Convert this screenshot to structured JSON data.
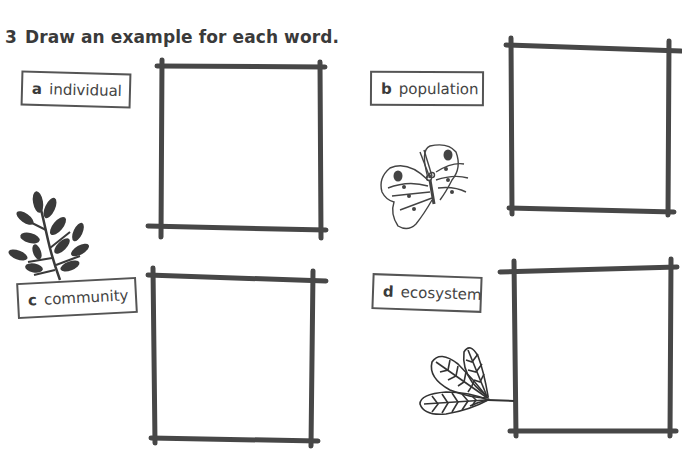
{
  "question": {
    "number": "3",
    "instruction": "Draw an example for each word."
  },
  "items": [
    {
      "letter": "a",
      "word": "individual",
      "illustration": "leafy-branch-icon"
    },
    {
      "letter": "b",
      "word": "population",
      "illustration": "butterfly-icon"
    },
    {
      "letter": "c",
      "word": "community",
      "illustration": "leafy-branch-icon"
    },
    {
      "letter": "d",
      "word": "ecosystem",
      "illustration": "fern-leaf-icon"
    }
  ],
  "colors": {
    "ink": "#3a3a3a",
    "box_stroke": "#474747",
    "label_border": "#555555",
    "background": "#ffffff"
  }
}
